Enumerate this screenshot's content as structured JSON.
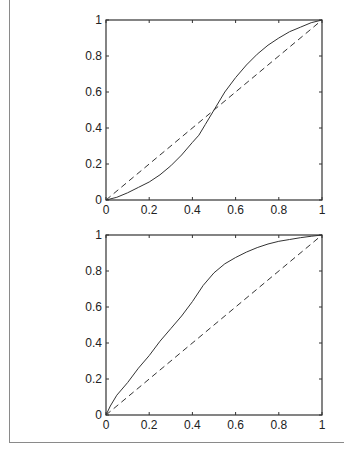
{
  "chart_data": [
    {
      "type": "line",
      "title": "",
      "xlabel": "",
      "ylabel": "",
      "xlim": [
        0,
        1
      ],
      "ylim": [
        0,
        1
      ],
      "grid": false,
      "x_ticks": [
        "0",
        "0.2",
        "0.4",
        "0.6",
        "0.8",
        "1"
      ],
      "y_ticks": [
        "0",
        "0.2",
        "0.4",
        "0.6",
        "0.8",
        "1"
      ],
      "series": [
        {
          "name": "curve",
          "style": "solid",
          "x": [
            0,
            0.05,
            0.1,
            0.15,
            0.2,
            0.25,
            0.3,
            0.35,
            0.4,
            0.43,
            0.46,
            0.5,
            0.55,
            0.6,
            0.65,
            0.7,
            0.75,
            0.8,
            0.85,
            0.9,
            0.95,
            1.0
          ],
          "y": [
            0,
            0.015,
            0.04,
            0.07,
            0.1,
            0.14,
            0.19,
            0.25,
            0.32,
            0.36,
            0.42,
            0.5,
            0.6,
            0.68,
            0.75,
            0.81,
            0.86,
            0.9,
            0.935,
            0.96,
            0.985,
            1.0
          ]
        },
        {
          "name": "diagonal",
          "style": "dashed",
          "x": [
            0,
            1
          ],
          "y": [
            0,
            1
          ]
        }
      ]
    },
    {
      "type": "line",
      "title": "",
      "xlabel": "",
      "ylabel": "",
      "xlim": [
        0,
        1
      ],
      "ylim": [
        0,
        1
      ],
      "grid": false,
      "x_ticks": [
        "0",
        "0.2",
        "0.4",
        "0.6",
        "0.8",
        "1"
      ],
      "y_ticks": [
        "0",
        "0.2",
        "0.4",
        "0.6",
        "0.8",
        "1"
      ],
      "series": [
        {
          "name": "curve",
          "style": "solid",
          "x": [
            0,
            0.02,
            0.05,
            0.1,
            0.15,
            0.2,
            0.25,
            0.3,
            0.35,
            0.4,
            0.45,
            0.5,
            0.55,
            0.6,
            0.65,
            0.7,
            0.75,
            0.8,
            0.85,
            0.9,
            0.95,
            1.0
          ],
          "y": [
            0,
            0.05,
            0.11,
            0.18,
            0.26,
            0.33,
            0.41,
            0.48,
            0.55,
            0.63,
            0.72,
            0.79,
            0.84,
            0.875,
            0.905,
            0.93,
            0.95,
            0.965,
            0.975,
            0.985,
            0.993,
            1.0
          ]
        },
        {
          "name": "diagonal",
          "style": "dashed",
          "x": [
            0,
            1
          ],
          "y": [
            0,
            1
          ]
        }
      ]
    }
  ],
  "layout": {
    "plots": [
      {
        "left": 106,
        "top": 20,
        "width": 216,
        "height": 180
      },
      {
        "left": 106,
        "top": 235,
        "width": 216,
        "height": 180
      }
    ]
  }
}
